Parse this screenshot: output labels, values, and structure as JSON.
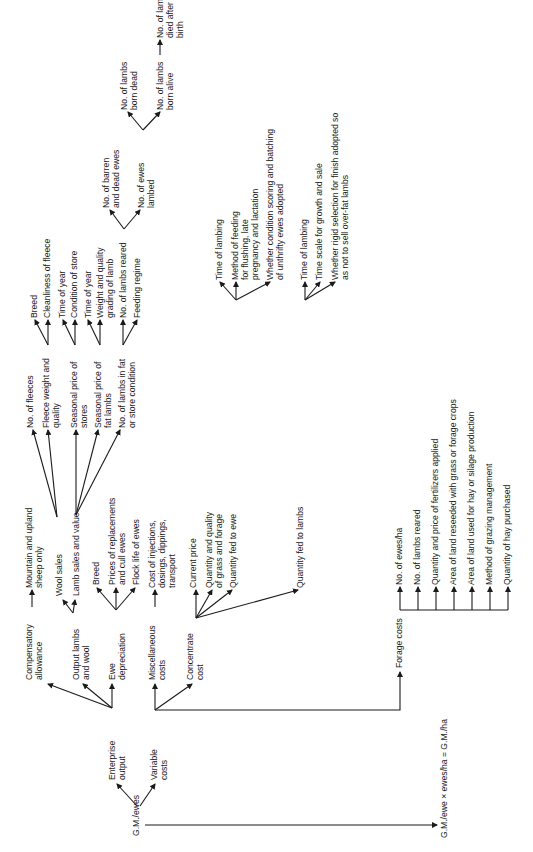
{
  "diagram": {
    "orientation": "rotated -90deg (read bottom-to-top)",
    "root": "G.M./ewes",
    "result": "G.M./ewe × ewes/ha = G.M./ha",
    "branches": {
      "enterprise_output": {
        "label": "Enterprise output",
        "children": {
          "compensatory_allowance": {
            "label": "Compensatory allowance",
            "children": [
              "Mountain and upland sheep only"
            ]
          },
          "output_lambs_wool": {
            "label": "Output lambs and wool",
            "children": {
              "wool_sales": {
                "label": "Wool sales",
                "children": {
                  "no_fleeces": "No. of fleeces",
                  "fleece_weight": {
                    "label": "Fleece weight and quality",
                    "children": [
                      "Breed",
                      "Cleanliness of fleece"
                    ]
                  }
                }
              },
              "lamb_sales": {
                "label": "Lamb sales and value",
                "children": {
                  "seasonal_stores": {
                    "label": "Seasonal price of stores",
                    "children": [
                      "Time of year",
                      "Condition of store"
                    ]
                  },
                  "seasonal_fat": {
                    "label": "Seasonal price of fat lambs",
                    "children": [
                      "Time of year",
                      "Weight and quality grading of lamb"
                    ]
                  },
                  "lambs_fat_store": {
                    "label": "No. of lambs in fat or store condition",
                    "children": {
                      "lambs_reared": {
                        "label": "No. of lambs reared",
                        "children": {
                          "barren": "No. of barren and dead ewes",
                          "ewes_lambed": {
                            "label": "No. of ewes lambed",
                            "children": {
                              "born_dead": "No. of lambs born dead",
                              "born_alive": {
                                "label": "No. of lambs born alive",
                                "children": [
                                  "No. of lambs died after birth"
                                ]
                              }
                            }
                          }
                        }
                      },
                      "feeding_regime": "Feeding regime"
                    }
                  }
                }
              }
            }
          },
          "ewe_depreciation": {
            "label": "Ewe depreciation",
            "children": [
              "Breed",
              "Prices of replacements and cull ewes",
              "Flock life of ewes"
            ]
          }
        }
      },
      "variable_costs": {
        "label": "Variable costs",
        "children": {
          "misc": {
            "label": "Miscellaneous costs",
            "children": [
              "Cost of injections, dosings, dippings, transport"
            ]
          },
          "concentrate": {
            "label": "Concentrate cost",
            "children": {
              "current_price": "Current price",
              "grass_forage": "Quantity and quality of grass and forage",
              "fed_to_ewe": {
                "label": "Quantity fed to ewe",
                "children": [
                  "Time of lambing",
                  "Method of feeding for flushing, late pregnancy and lactation",
                  "Whether condition scoring and batching of unthrifty ewes adopted"
                ]
              },
              "fed_to_lambs": {
                "label": "Quantity fed to lambs",
                "children": [
                  "Time of lambing",
                  "Time scale for growth and sale",
                  "Whether rigid selection for finish adopted so as not to sell over-fat lambs"
                ]
              }
            }
          },
          "forage": {
            "label": "Forage costs",
            "children": [
              "No. of ewes/ha",
              "No. of lambs reared",
              "Quantity and price of fertilizers applied",
              "Area of land reseeded with grass or forage crops",
              "Area of land used for hay or silage production",
              "Method of grazing management",
              "Quantity of hay purchased"
            ]
          }
        }
      }
    }
  },
  "labels": {
    "root": "G.M./ewes",
    "enterprise": [
      "Enterprise",
      "output"
    ],
    "variable": [
      "Variable",
      "costs"
    ],
    "comp": [
      "Compensatory",
      "allowance"
    ],
    "mountain": [
      "Mountain and upland",
      "sheep only"
    ],
    "output_lw": [
      "Output lambs",
      "and wool"
    ],
    "ewe_dep": [
      "Ewe",
      "depreciation"
    ],
    "wool": "Wool sales",
    "lamb_sales": "Lamb sales and value",
    "breed1": "Breed",
    "prices_repl": [
      "Prices of replacements",
      "and cull ewes"
    ],
    "flock_life": "Flock life of ewes",
    "no_fleeces": "No. of fleeces",
    "fleece_wq": [
      "Fleece weight and",
      "quality"
    ],
    "seas_stores": [
      "Seasonal price of",
      "stores"
    ],
    "seas_fat": [
      "Seasonal price of",
      "fat lambs"
    ],
    "lambs_fat": [
      "No. of lambs in fat",
      "or store condition"
    ],
    "breed2": "Breed",
    "clean": "Cleanliness of fleece",
    "time_yr1": "Time of year",
    "cond_store": "Condition of store",
    "time_yr2": "Time of year",
    "weight_q": [
      "Weight and quality",
      "grading of lamb"
    ],
    "lambs_reared": "No. of lambs reared",
    "feeding": "Feeding regime",
    "barren": [
      "No. of barren",
      "and dead ewes"
    ],
    "ewes_lambed": [
      "No. of ewes",
      "lambed"
    ],
    "born_dead": [
      "No. of lambs",
      "born dead"
    ],
    "born_alive": [
      "No. of lambs",
      "born alive"
    ],
    "died": [
      "No. of lambs",
      "died after",
      "birth"
    ],
    "misc": [
      "Miscellaneous",
      "costs"
    ],
    "misc_leaf": [
      "Cost of injections,",
      "dosings, dippings,",
      "transport"
    ],
    "conc": [
      "Concentrate",
      "cost"
    ],
    "cur_price": "Current price",
    "qty_grass": [
      "Quantity and quality",
      "of grass and forage"
    ],
    "qty_ewe": "Quantity fed to ewe",
    "qty_lambs": "Quantity fed to lambs",
    "t_lamb1": "Time of lambing",
    "method_feed": [
      "Method of feeding",
      "for flushing, late",
      "pregnancy and lactation"
    ],
    "whether_cond": [
      "Whether condition scoring and batching",
      "of unthrifty ewes adopted"
    ],
    "t_lamb2": "Time of lambing",
    "time_scale": "Time scale for growth and sale",
    "whether_rigid": [
      "Whether rigid selection for finish adopted so",
      "as not to sell over-fat lambs"
    ],
    "forage": "Forage costs",
    "f1": "No. of ewes/ha",
    "f2": "No. of lambs reared",
    "f3": "Quantity and price of fertilizers applied",
    "f4": "Area of land reseeded with grass or forage crops",
    "f5": "Area of land used for hay or silage production",
    "f6": "Method of grazing management",
    "f7": "Quantity of hay purchased",
    "result": "G.M./ewe × ewes/ha = G.M./ha"
  },
  "colors": {
    "ink": "#1a1a1a",
    "background": "#ffffff"
  }
}
